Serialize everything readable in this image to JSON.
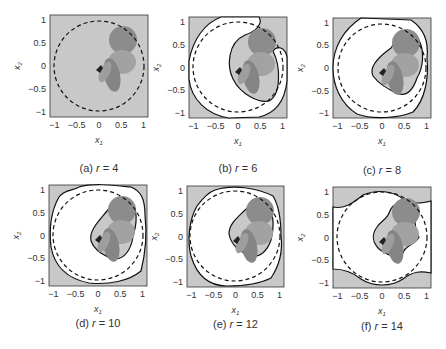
{
  "figure": {
    "panels": [
      {
        "id": "a",
        "caption": "(a) r = 4",
        "r": 4
      },
      {
        "id": "b",
        "caption": "(b) r = 6",
        "r": 6
      },
      {
        "id": "c",
        "caption": "(c) r = 8",
        "r": 8
      },
      {
        "id": "d",
        "caption": "(d) r = 10",
        "r": 10
      },
      {
        "id": "e",
        "caption": "(e) r = 12",
        "r": 12
      },
      {
        "id": "f",
        "caption": "(f) r = 14",
        "r": 14
      }
    ],
    "xlabel": "x1",
    "ylabel": "x2",
    "xticks": [
      "-1",
      "-0.5",
      "0",
      "0.5",
      "1"
    ],
    "yticks": [
      "1",
      "0.5",
      "0",
      "-0.5",
      "-1"
    ],
    "colors": {
      "background": "#c8c8c8",
      "region": "#ffffff",
      "boundary": "#111111",
      "obstacle_dark": "#7a7a7a",
      "obstacle_mid": "#9a9a9a",
      "obstacle_light": "#b4b4b4"
    }
  },
  "chart_data": [
    {
      "type": "scatter",
      "title": "(a) r = 4",
      "xlabel": "x1",
      "ylabel": "x2",
      "xlim": [
        -1.1,
        1.1
      ],
      "ylim": [
        -1.1,
        1.1
      ],
      "annotations": [
        "dashed unit circle",
        "shaded obstacle blobs near (0.5,0.5),(0.45,0.1),(0.3,-0.3)"
      ],
      "estimated_region": "none (entire square shaded)"
    },
    {
      "type": "scatter",
      "title": "(b) r = 6",
      "xlabel": "x1",
      "ylabel": "x2",
      "xlim": [
        -1.1,
        1.1
      ],
      "ylim": [
        -1.1,
        1.1
      ],
      "annotations": [
        "dashed unit circle",
        "crescent-shaped white region"
      ]
    },
    {
      "type": "scatter",
      "title": "(c) r = 8",
      "xlabel": "x1",
      "ylabel": "x2",
      "xlim": [
        -1.1,
        1.1
      ],
      "ylim": [
        -1.1,
        1.1
      ],
      "annotations": [
        "dashed unit circle",
        "white region approx. circle minus obstacle hull"
      ]
    },
    {
      "type": "scatter",
      "title": "(d) r = 10",
      "xlabel": "x1",
      "ylabel": "x2",
      "xlim": [
        -1.1,
        1.1
      ],
      "ylim": [
        -1.1,
        1.1
      ]
    },
    {
      "type": "scatter",
      "title": "(e) r = 12",
      "xlabel": "x1",
      "ylabel": "x2",
      "xlim": [
        -1.1,
        1.1
      ],
      "ylim": [
        -1.1,
        1.1
      ]
    },
    {
      "type": "scatter",
      "title": "(f) r = 14",
      "xlabel": "x1",
      "ylabel": "x2",
      "xlim": [
        -1.1,
        1.1
      ],
      "ylim": [
        -1.1,
        1.1
      ]
    }
  ]
}
